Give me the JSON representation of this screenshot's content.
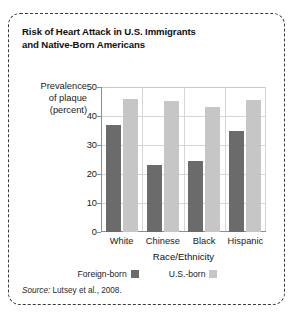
{
  "figure": {
    "title": "Risk of Heart Attack in U.S. Immigrants and Native-Born Americans",
    "title_line1": "Risk of Heart Attack in U.S. Immigrants",
    "title_line2": "and Native-Born Americans",
    "source_prefix": "Source:",
    "source_text": " Lutsey et al., 2008.",
    "border_color": "#3b3b3b"
  },
  "chart_data": {
    "type": "bar",
    "title": "Risk of Heart Attack in U.S. Immigrants and Native-Born Americans",
    "categories": [
      "White",
      "Chinese",
      "Black",
      "Hispanic"
    ],
    "series": [
      {
        "name": "Foreign-born",
        "color": "#6b6b6b",
        "values": [
          37,
          23,
          24.5,
          35
        ]
      },
      {
        "name": "U.S.-born",
        "color": "#c6c6c6",
        "values": [
          46,
          45.3,
          43.2,
          45.5
        ]
      }
    ],
    "xlabel": "Race/Ethnicity",
    "ylabel": "Prevalence of plaque (percent)",
    "ylabel_line1": "Prevalence",
    "ylabel_line2": "of plaque",
    "ylabel_line3": "(percent)",
    "ylim": [
      0,
      50
    ],
    "yticks": [
      0,
      10,
      20,
      30,
      40,
      50
    ],
    "ytick_labels": [
      "0",
      "10",
      "20",
      "30",
      "40",
      "50"
    ],
    "grid": true,
    "legend_position": "bottom"
  }
}
